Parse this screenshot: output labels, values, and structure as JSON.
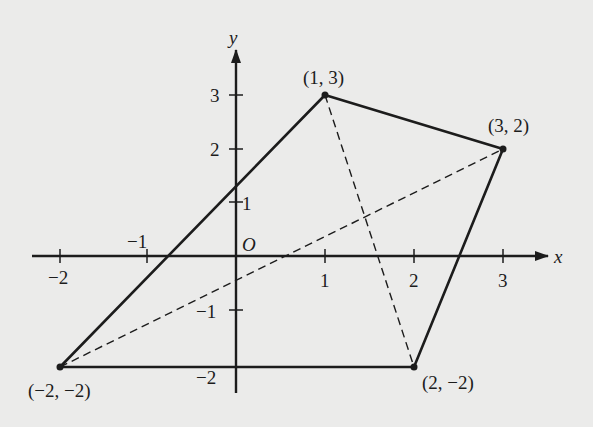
{
  "figure": {
    "type": "coordinate-plane-quadrilateral",
    "axes": {
      "x_label": "x",
      "y_label": "y",
      "origin_label": "O",
      "x_ticks": [
        {
          "value": -2,
          "label": "−2"
        },
        {
          "value": -1,
          "label": "−1"
        },
        {
          "value": 1,
          "label": "1"
        },
        {
          "value": 2,
          "label": "2"
        },
        {
          "value": 3,
          "label": "3"
        }
      ],
      "y_ticks": [
        {
          "value": 3,
          "label": "3"
        },
        {
          "value": 2,
          "label": "2"
        },
        {
          "value": 1,
          "label": "1"
        },
        {
          "value": -1,
          "label": "−1"
        },
        {
          "value": -2,
          "label": "−2"
        }
      ]
    },
    "vertices": [
      {
        "x": 1,
        "y": 3,
        "label": "(1, 3)"
      },
      {
        "x": 3,
        "y": 2,
        "label": "(3, 2)"
      },
      {
        "x": 2,
        "y": -2,
        "label": "(2, −2)"
      },
      {
        "x": -2,
        "y": -2,
        "label": "(−2, −2)"
      }
    ],
    "edges": [
      {
        "from": "(-2,-2)",
        "to": "(1,3)",
        "style": "solid"
      },
      {
        "from": "(1,3)",
        "to": "(3,2)",
        "style": "solid"
      },
      {
        "from": "(3,2)",
        "to": "(2,-2)",
        "style": "solid"
      },
      {
        "from": "(2,-2)",
        "to": "(-2,-2)",
        "style": "solid"
      }
    ],
    "diagonals": [
      {
        "from": "(1,3)",
        "to": "(2,-2)",
        "style": "dashed"
      },
      {
        "from": "(-2,-2)",
        "to": "(3,2)",
        "style": "dashed"
      }
    ],
    "colors": {
      "ink": "#1c1c1c",
      "paper": "#ebebea"
    }
  }
}
